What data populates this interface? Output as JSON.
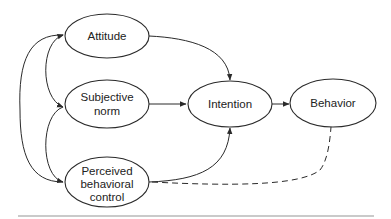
{
  "diagram": {
    "nodes": [
      {
        "id": "attitude",
        "lines": [
          "Attitude"
        ]
      },
      {
        "id": "subjective_norm",
        "lines": [
          "Subjective",
          "norm"
        ]
      },
      {
        "id": "perceived_behavioral_control",
        "lines": [
          "Perceived",
          "behavioral",
          "control"
        ]
      },
      {
        "id": "intention",
        "lines": [
          "Intention"
        ]
      },
      {
        "id": "behavior",
        "lines": [
          "Behavior"
        ]
      }
    ],
    "edges": [
      {
        "from": "attitude",
        "to": "intention",
        "style": "solid"
      },
      {
        "from": "subjective_norm",
        "to": "intention",
        "style": "solid"
      },
      {
        "from": "perceived_behavioral_control",
        "to": "intention",
        "style": "solid"
      },
      {
        "from": "intention",
        "to": "behavior",
        "style": "solid"
      },
      {
        "from": "perceived_behavioral_control",
        "to": "behavior",
        "style": "dashed"
      },
      {
        "from": "attitude",
        "to": "subjective_norm",
        "style": "solid",
        "bidirectional": true
      },
      {
        "from": "subjective_norm",
        "to": "perceived_behavioral_control",
        "style": "solid",
        "bidirectional": true
      },
      {
        "from": "attitude",
        "to": "perceived_behavioral_control",
        "style": "solid",
        "bidirectional": true
      }
    ],
    "colors": {
      "stroke": "#2a2a2a",
      "text": "#222222",
      "rule": "#b8b8b8",
      "background": "#ffffff"
    }
  }
}
